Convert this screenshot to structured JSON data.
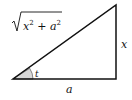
{
  "diagram": {
    "type": "right-triangle",
    "labels": {
      "hypotenuse": "x² + a²",
      "opposite": "x",
      "adjacent": "a",
      "angle": "t"
    },
    "colors": {
      "stroke": "#111111",
      "angle_fill": "#d8d8d8"
    }
  }
}
